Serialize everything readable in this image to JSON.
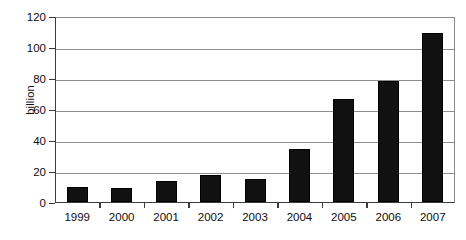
{
  "chart_data": {
    "type": "bar",
    "title": "",
    "subtitle": "",
    "xlabel": "",
    "ylabel": "billion",
    "categories": [
      "1999",
      "2000",
      "2001",
      "2002",
      "2003",
      "2004",
      "2005",
      "2006",
      "2007"
    ],
    "values": [
      9.5,
      9,
      13.5,
      17.5,
      15,
      34,
      66.5,
      78,
      109
    ],
    "ylim": [
      0,
      120
    ],
    "yticks": [
      0,
      20,
      40,
      60,
      80,
      100,
      120
    ],
    "ytick_labels": [
      "0",
      "20",
      "40",
      "60",
      "80",
      "100",
      "120"
    ],
    "grid": true,
    "grid_axis": "y",
    "legend": false,
    "legend_position": "none",
    "bar_color": "#111111",
    "axis_color": "#3b3b3b",
    "grid_color": "#8e8e8e",
    "background": "#ffffff"
  },
  "axis": {
    "y_title": "billion"
  }
}
